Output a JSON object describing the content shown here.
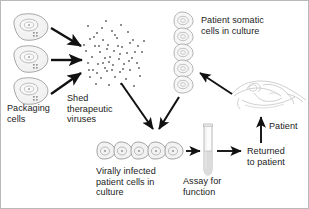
{
  "figure": {
    "type": "flow-diagram",
    "width": 309,
    "height": 209,
    "background_color": "#ffffff",
    "border_color": "#b9b9b9"
  },
  "labels": {
    "packaging_cells": "Packaging\ncells",
    "shed_viruses": "Shed\ntherapeutic\nviruses",
    "patient_somatic_cells": "Patient somatic\ncells in culture",
    "virally_infected": "Virally infected\npatient cells in\nculture",
    "assay_for_function": "Assay for\nfunction",
    "returned_to_patient": "Returned\nto patient",
    "patient": "Patient"
  },
  "elements": {
    "packaging_cells": {
      "name": "packaging-cells-group",
      "count": 3,
      "description": "three amoeboid packaging cells stacked vertically at left",
      "outline_color": "#9a9a9a",
      "fill_color": "#f2f2f2"
    },
    "virus_cloud": {
      "name": "shed-virus-cloud",
      "count": 62,
      "description": "scattered small gray dots representing shed therapeutic virus particles",
      "dot_color": "#8e8e8e",
      "dot_size_px": 2
    },
    "somatic_cell_stack": {
      "name": "patient-somatic-cell-stack",
      "count": 5,
      "description": "five teardrop cells stacked vertically at upper right",
      "outline_color": "#a3a3a3",
      "fill_color": "#f4f4f4"
    },
    "infected_cell_row": {
      "name": "virally-infected-cell-row",
      "count": 5,
      "description": "five teardrop cells in a horizontal row at bottom center",
      "outline_color": "#8f8f8f",
      "fill_color": "#f1f1f1"
    },
    "test_tube": {
      "name": "assay-test-tube",
      "description": "vertical test tube, lower half filled with liquid",
      "outline_color": "#b0b0b0",
      "liquid_color": "#d8d8d8"
    },
    "patient_illustration": {
      "name": "patient-on-bed-illustration",
      "description": "faint line drawing of a patient reclining on a table",
      "line_color": "#c4c4c4"
    }
  },
  "arrows": [
    {
      "name": "arrow-packaging-1-to-cloud",
      "from": "packaging cell 1",
      "to": "virus cloud",
      "direction": "down-right"
    },
    {
      "name": "arrow-packaging-2-to-cloud",
      "from": "packaging cell 2",
      "to": "virus cloud",
      "direction": "right"
    },
    {
      "name": "arrow-packaging-3-to-cloud",
      "from": "packaging cell 3",
      "to": "virus cloud",
      "direction": "up-right"
    },
    {
      "name": "arrow-cloud-to-infected",
      "from": "virus cloud",
      "to": "infected cells",
      "direction": "down-right"
    },
    {
      "name": "arrow-somatic-to-infected",
      "from": "somatic cell stack",
      "to": "infected cells",
      "direction": "down-left"
    },
    {
      "name": "arrow-patient-to-somatic",
      "from": "patient",
      "to": "somatic cell stack",
      "direction": "up-left"
    },
    {
      "name": "arrow-infected-to-tube",
      "from": "infected cells",
      "to": "test tube",
      "direction": "right"
    },
    {
      "name": "arrow-tube-to-returned",
      "from": "test tube",
      "to": "returned to patient",
      "direction": "right"
    },
    {
      "name": "arrow-returned-to-patient",
      "from": "returned to patient",
      "to": "patient",
      "direction": "up"
    }
  ],
  "colors": {
    "arrow": "#111111",
    "text": "#1b1b1b",
    "cell_outline": "#9a9a9a",
    "cell_fill": "#f2f2f2",
    "virus_dot": "#8e8e8e"
  }
}
